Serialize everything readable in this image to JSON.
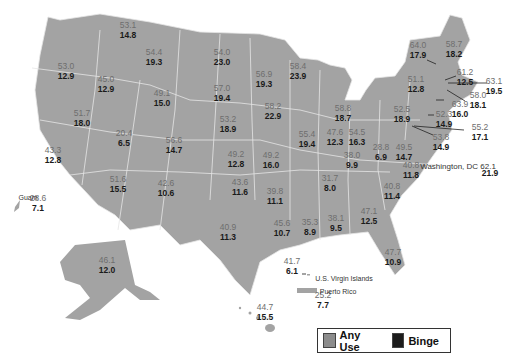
{
  "colors": {
    "land": "#a3a3a3",
    "border": "#e6e6e6",
    "any_use": "#8c8c8c",
    "binge": "#1c1c1c"
  },
  "legend": {
    "any_use_label": "Any Use",
    "binge_label": "Binge"
  },
  "chart_data": {
    "type": "choropleth-map-labels",
    "title": "",
    "legend": [
      "Any Use",
      "Binge"
    ],
    "units": "percent",
    "regions": [
      {
        "name": "Washington",
        "any": "53.1",
        "binge": "14.8",
        "x": 128,
        "y": 26
      },
      {
        "name": "Oregon",
        "any": "53.0",
        "binge": "12.9",
        "x": 66,
        "y": 67
      },
      {
        "name": "Idaho",
        "any": "45.0",
        "binge": "12.9",
        "x": 106,
        "y": 80
      },
      {
        "name": "Montana",
        "any": "54.4",
        "binge": "19.3",
        "x": 154,
        "y": 53
      },
      {
        "name": "Wyoming",
        "any": "49.1",
        "binge": "15.0",
        "x": 162,
        "y": 94
      },
      {
        "name": "Nevada",
        "any": "51.7",
        "binge": "18.0",
        "x": 82,
        "y": 114
      },
      {
        "name": "California",
        "any": "43.3",
        "binge": "12.8",
        "x": 53,
        "y": 151
      },
      {
        "name": "Utah",
        "any": "20.4",
        "binge": "6.5",
        "x": 124,
        "y": 134
      },
      {
        "name": "Colorado",
        "any": "56.6",
        "binge": "14.7",
        "x": 174,
        "y": 141
      },
      {
        "name": "Arizona",
        "any": "51.6",
        "binge": "15.5",
        "x": 118,
        "y": 180
      },
      {
        "name": "New Mexico",
        "any": "42.6",
        "binge": "10.6",
        "x": 166,
        "y": 184
      },
      {
        "name": "North Dakota",
        "any": "54.0",
        "binge": "23.0",
        "x": 222,
        "y": 53
      },
      {
        "name": "South Dakota",
        "any": "57.0",
        "binge": "19.4",
        "x": 222,
        "y": 89
      },
      {
        "name": "Nebraska",
        "any": "53.2",
        "binge": "18.9",
        "x": 228,
        "y": 120
      },
      {
        "name": "Kansas",
        "any": "49.2",
        "binge": "12.8",
        "x": 236,
        "y": 155
      },
      {
        "name": "Oklahoma",
        "any": "43.6",
        "binge": "11.6",
        "x": 240,
        "y": 183
      },
      {
        "name": "Texas",
        "any": "40.9",
        "binge": "11.3",
        "x": 228,
        "y": 228
      },
      {
        "name": "Minnesota",
        "any": "56.9",
        "binge": "19.3",
        "x": 264,
        "y": 75
      },
      {
        "name": "Iowa",
        "any": "58.2",
        "binge": "22.9",
        "x": 273,
        "y": 107
      },
      {
        "name": "Missouri",
        "any": "49.2",
        "binge": "16.0",
        "x": 271,
        "y": 156
      },
      {
        "name": "Arkansas",
        "any": "39.8",
        "binge": "11.1",
        "x": 275,
        "y": 192
      },
      {
        "name": "Louisiana",
        "any": "45.6",
        "binge": "10.7",
        "x": 282,
        "y": 224
      },
      {
        "name": "Wisconsin",
        "any": "58.4",
        "binge": "23.9",
        "x": 298,
        "y": 67
      },
      {
        "name": "Illinois",
        "any": "55.4",
        "binge": "19.4",
        "x": 307,
        "y": 135
      },
      {
        "name": "Michigan",
        "any": "58.8",
        "binge": "18.7",
        "x": 343,
        "y": 109
      },
      {
        "name": "Indiana",
        "any": "47.6",
        "binge": "12.3",
        "x": 335,
        "y": 133
      },
      {
        "name": "Ohio",
        "any": "54.5",
        "binge": "16.3",
        "x": 357,
        "y": 133
      },
      {
        "name": "Kentucky",
        "any": "38.0",
        "binge": "9.9",
        "x": 352,
        "y": 156
      },
      {
        "name": "Tennessee",
        "any": "31.7",
        "binge": "8.0",
        "x": 330,
        "y": 179
      },
      {
        "name": "Mississippi",
        "any": "35.3",
        "binge": "8.9",
        "x": 310,
        "y": 223
      },
      {
        "name": "Alabama",
        "any": "38.1",
        "binge": "9.5",
        "x": 336,
        "y": 219
      },
      {
        "name": "Georgia",
        "any": "47.1",
        "binge": "12.5",
        "x": 369,
        "y": 212
      },
      {
        "name": "Florida",
        "any": "47.7",
        "binge": "10.9",
        "x": 393,
        "y": 253
      },
      {
        "name": "South Carolina",
        "any": "40.8",
        "binge": "11.4",
        "x": 392,
        "y": 187
      },
      {
        "name": "North Carolina",
        "any": "40.8",
        "binge": "11.8",
        "x": 411,
        "y": 166
      },
      {
        "name": "West Virginia",
        "any": "28.8",
        "binge": "6.9",
        "x": 381,
        "y": 148
      },
      {
        "name": "Virginia",
        "any": "49.5",
        "binge": "14.7",
        "x": 404,
        "y": 148
      },
      {
        "name": "Pennsylvania",
        "any": "52.5",
        "binge": "18.9",
        "x": 402,
        "y": 110
      },
      {
        "name": "New York",
        "any": "51.1",
        "binge": "12.8",
        "x": 416,
        "y": 80
      },
      {
        "name": "Vermont",
        "any": "64.0",
        "binge": "17.9",
        "x": 418,
        "y": 46
      },
      {
        "name": "Maine",
        "any": "58.7",
        "binge": "18.2",
        "x": 454,
        "y": 45
      },
      {
        "name": "New Hampshire",
        "any": "61.2",
        "binge": "12.5",
        "x": 465,
        "y": 73
      },
      {
        "name": "Massachusetts",
        "any": "63.1",
        "binge": "19.5",
        "x": 494,
        "y": 82
      },
      {
        "name": "Rhode Island",
        "any": "58.0",
        "binge": "18.1",
        "x": 478,
        "y": 96
      },
      {
        "name": "Connecticut",
        "any": "63.9",
        "binge": "16.0",
        "x": 460,
        "y": 105
      },
      {
        "name": "New Jersey",
        "any": "52.3",
        "binge": "14.9",
        "x": 444,
        "y": 115
      },
      {
        "name": "Delaware",
        "any": "55.2",
        "binge": "17.1",
        "x": 480,
        "y": 128
      },
      {
        "name": "Maryland",
        "any": "53.8",
        "binge": "14.9",
        "x": 441,
        "y": 138
      },
      {
        "name": "Washington, DC",
        "any": "62.1",
        "binge": "21.9",
        "x": 472,
        "y": 160
      },
      {
        "name": "Alaska",
        "any": "46.1",
        "binge": "12.0",
        "x": 107,
        "y": 261
      },
      {
        "name": "Hawaii",
        "any": "44.7",
        "binge": "15.5",
        "x": 265,
        "y": 308
      },
      {
        "name": "Guam",
        "any": "28.6",
        "binge": "7.1",
        "x": 38,
        "y": 199
      },
      {
        "name": "U.S. Virgin Islands",
        "any": "41.7",
        "binge": "6.1",
        "x": 292,
        "y": 262
      },
      {
        "name": "Puerto Rico",
        "any": "25.2",
        "binge": "7.7",
        "x": 323,
        "y": 296
      }
    ]
  },
  "territory_names": {
    "guam": "Guam",
    "usvi": "U.S. Virgin Islands",
    "pr": "Puerto Rico",
    "dc": "Washington, DC 62.1",
    "dc_binge": "21.9"
  }
}
